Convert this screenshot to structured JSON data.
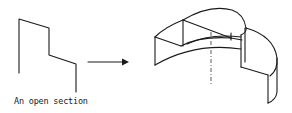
{
  "figure": {
    "caption": "An open section",
    "elements": {
      "profile": "open-section-profile",
      "arrow": "right-arrow",
      "solid": "revolved-open-section-solid",
      "axis": "axis-of-revolution"
    },
    "colors": {
      "stroke": "#1a1a1a",
      "background": "#ffffff"
    }
  }
}
